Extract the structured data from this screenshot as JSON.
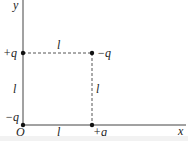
{
  "diagram": {
    "axes": {
      "x_label": "x",
      "y_label": "y",
      "origin_label": "O"
    },
    "charges": [
      {
        "id": "origin",
        "label": "−q",
        "position": "bottom-left"
      },
      {
        "id": "top-left",
        "label": "+q",
        "position": "top-left"
      },
      {
        "id": "top-right",
        "label": "−q",
        "position": "top-right"
      },
      {
        "id": "bottom-right",
        "label": "+q",
        "position": "bottom-right"
      }
    ],
    "sides": {
      "top": "l",
      "left": "l",
      "right": "l",
      "bottom": "l"
    },
    "colors": {
      "line": "#333333",
      "dashed": "#555555",
      "point": "#111111"
    }
  }
}
